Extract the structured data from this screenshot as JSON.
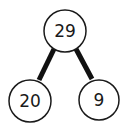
{
  "diagram": {
    "type": "number-bond",
    "whole": {
      "label": "29"
    },
    "parts": [
      {
        "label": "20"
      },
      {
        "label": "9"
      }
    ],
    "colors": {
      "stroke": "#1a1a1a",
      "fill": "#ffffff",
      "text": "#1a1a1a"
    }
  }
}
